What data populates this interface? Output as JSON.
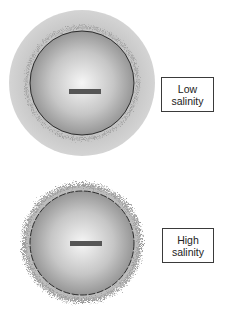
{
  "panels": [
    {
      "id": "low",
      "label_line1": "Low",
      "label_line2": "salinity",
      "charge_symbol": "minus",
      "layer": "diffuse-halo"
    },
    {
      "id": "high",
      "label_line1": "High",
      "label_line2": "salinity",
      "charge_symbol": "minus",
      "layer": "compressed-fuzzy"
    }
  ],
  "colors": {
    "halo": "#cfcfcf",
    "sphere_center": "#f4f4f4",
    "sphere_edge": "#8c8c8c",
    "outline": "#222222",
    "minus_bar": "#555555",
    "fuzz": "#9a9a9a"
  }
}
